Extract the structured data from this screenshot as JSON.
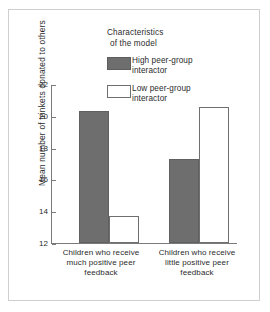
{
  "chart_data": {
    "type": "bar",
    "title": "",
    "xlabel": "",
    "ylabel": "Mean number of trinkets donated to others",
    "ylim": [
      12,
      22
    ],
    "yticks": [
      12,
      14,
      16,
      18,
      20,
      22
    ],
    "ytick_labels": [
      "12",
      "14",
      "16",
      "18",
      "20",
      "22"
    ],
    "grid": false,
    "legend_position": "top-right-inside",
    "legend_title_line1": "Characteristics",
    "legend_title_line2": "of the model",
    "categories": [
      "Children who receive much positive peer feedback",
      "Children who receive little positive peer feedback"
    ],
    "category_label_lines": [
      [
        "Children who receive",
        "much positive peer",
        "feedback"
      ],
      [
        "Children who receive",
        "little positive peer",
        "feedback"
      ]
    ],
    "series": [
      {
        "name": "High peer-group interactor",
        "name_lines": [
          "High peer-group",
          "interactor"
        ],
        "color": "#6e6e6e",
        "style": "filled",
        "values": [
          20.3,
          17.3
        ]
      },
      {
        "name": "Low peer-group interactor",
        "name_lines": [
          "Low peer-group",
          "interactor"
        ],
        "color": "#ffffff",
        "style": "hollow",
        "values": [
          13.7,
          20.55
        ]
      }
    ]
  },
  "colors": {
    "frame_border": "#cfcfcf",
    "axis": "#7a7a7a",
    "text": "#2b2b2b",
    "bar_filled": "#6e6e6e",
    "bar_hollow_border": "#6f6f6f",
    "background": "#ffffff"
  }
}
